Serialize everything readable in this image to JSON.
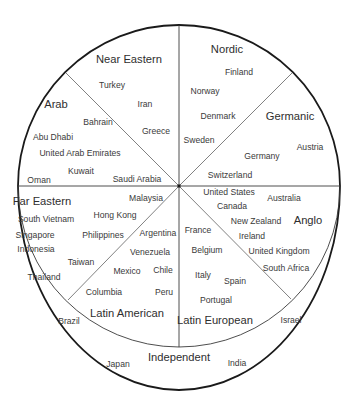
{
  "diagram": {
    "type": "cultural-cluster-circle",
    "geometry": {
      "center": [
        179,
        186
      ],
      "radius": 161,
      "outer_bottom_y": 390
    },
    "colors": {
      "line": "#1a1a1a",
      "text": "#3a3a3a"
    },
    "clusters": [
      {
        "name": "Near Eastern",
        "pos": [
          129,
          60
        ],
        "countries": [
          {
            "name": "Turkey",
            "pos": [
              112,
              85
            ]
          },
          {
            "name": "Iran",
            "pos": [
              145,
              104
            ]
          },
          {
            "name": "Greece",
            "pos": [
              156,
              131
            ]
          }
        ]
      },
      {
        "name": "Arab",
        "pos": [
          56,
          105
        ],
        "countries": [
          {
            "name": "Bahrain",
            "pos": [
              98,
              122
            ]
          },
          {
            "name": "Abu Dhabi",
            "pos": [
              53,
              137
            ]
          },
          {
            "name": "United Arab Emirates",
            "pos": [
              80,
              153
            ]
          },
          {
            "name": "Kuwait",
            "pos": [
              81,
              171
            ]
          },
          {
            "name": "Oman",
            "pos": [
              39,
              180
            ]
          },
          {
            "name": "Saudi Arabia",
            "pos": [
              137,
              179
            ]
          }
        ]
      },
      {
        "name": "Nordic",
        "pos": [
          227,
          50
        ],
        "countries": [
          {
            "name": "Finland",
            "pos": [
              239,
              72
            ]
          },
          {
            "name": "Norway",
            "pos": [
              205,
              91
            ]
          },
          {
            "name": "Denmark",
            "pos": [
              218,
              116
            ]
          },
          {
            "name": "Sweden",
            "pos": [
              199,
              140
            ]
          }
        ]
      },
      {
        "name": "Germanic",
        "pos": [
          290,
          117
        ],
        "countries": [
          {
            "name": "Austria",
            "pos": [
              310,
              147
            ]
          },
          {
            "name": "Germany",
            "pos": [
              262,
              156
            ]
          },
          {
            "name": "Switzerland",
            "pos": [
              230,
              175
            ]
          }
        ]
      },
      {
        "name": "Far Eastern",
        "pos": [
          42,
          202
        ],
        "countries": [
          {
            "name": "Malaysia",
            "pos": [
              146,
              198
            ]
          },
          {
            "name": "South Vietnam",
            "pos": [
              46,
              219
            ]
          },
          {
            "name": "Hong Kong",
            "pos": [
              115,
              215
            ]
          },
          {
            "name": "Singapore",
            "pos": [
              35,
              235
            ]
          },
          {
            "name": "Philippines",
            "pos": [
              103,
              235
            ]
          },
          {
            "name": "Indonesia",
            "pos": [
              36,
              249
            ]
          },
          {
            "name": "Taiwan",
            "pos": [
              81,
              262
            ]
          },
          {
            "name": "Thailand",
            "pos": [
              44,
              277
            ]
          }
        ]
      },
      {
        "name": "Latin American",
        "pos": [
          127,
          314
        ],
        "countries": [
          {
            "name": "Argentina",
            "pos": [
              158,
              233
            ]
          },
          {
            "name": "Venezuela",
            "pos": [
              150,
              252
            ]
          },
          {
            "name": "Mexico",
            "pos": [
              127,
              271
            ]
          },
          {
            "name": "Chile",
            "pos": [
              163,
              270
            ]
          },
          {
            "name": "Columbia",
            "pos": [
              104,
              292
            ]
          },
          {
            "name": "Peru",
            "pos": [
              164,
              292
            ]
          }
        ]
      },
      {
        "name": "Anglo",
        "pos": [
          308,
          221
        ],
        "countries": [
          {
            "name": "United States",
            "pos": [
              229,
              192
            ]
          },
          {
            "name": "Australia",
            "pos": [
              284,
              198
            ]
          },
          {
            "name": "Canada",
            "pos": [
              232,
              206
            ]
          },
          {
            "name": "New Zealand",
            "pos": [
              256,
              221
            ]
          },
          {
            "name": "Ireland",
            "pos": [
              252,
              236
            ]
          },
          {
            "name": "United Kingdom",
            "pos": [
              279,
              251
            ]
          },
          {
            "name": "South Africa",
            "pos": [
              286,
              268
            ]
          }
        ]
      },
      {
        "name": "Latin European",
        "pos": [
          215,
          321
        ],
        "countries": [
          {
            "name": "France",
            "pos": [
              198,
              230
            ]
          },
          {
            "name": "Belgium",
            "pos": [
              207,
              250
            ]
          },
          {
            "name": "Italy",
            "pos": [
              203,
              275
            ]
          },
          {
            "name": "Spain",
            "pos": [
              235,
              281
            ]
          },
          {
            "name": "Portugal",
            "pos": [
              216,
              300
            ]
          }
        ]
      },
      {
        "name": "Independent",
        "pos": [
          179,
          358
        ],
        "countries": [
          {
            "name": "Brazil",
            "pos": [
              69,
              321
            ]
          },
          {
            "name": "Israel",
            "pos": [
              291,
              320
            ]
          },
          {
            "name": "Japan",
            "pos": [
              118,
              364
            ]
          },
          {
            "name": "India",
            "pos": [
              237,
              363
            ]
          }
        ]
      }
    ]
  }
}
